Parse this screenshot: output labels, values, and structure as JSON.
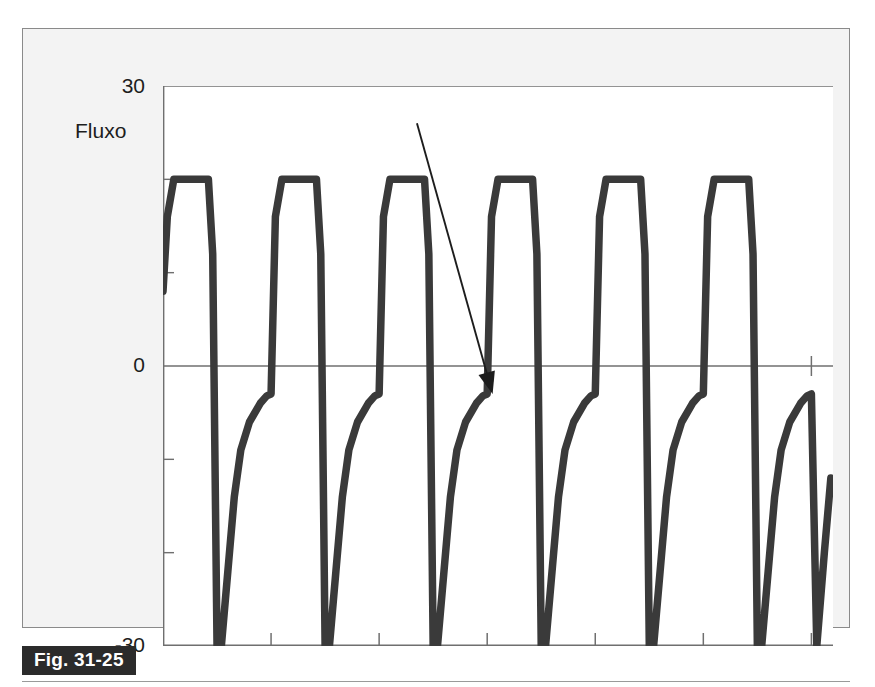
{
  "figure": {
    "caption_label": "Fig. 31-25",
    "axis_title": "Fluxo",
    "annotation": "Aprisionamento",
    "trace_label": "10"
  },
  "colors": {
    "trace": "#3a3a3a",
    "axis": "#6f6f6f",
    "panel_background": "#f3f3f3",
    "plot_background": "#ffffff",
    "caption_badge": "#2b2b2b",
    "text": "#1d1d1d"
  },
  "chart_data": {
    "type": "line",
    "title": "",
    "subtitle": "",
    "xlabel": "",
    "ylabel": "Fluxo",
    "ylim": [
      -30,
      30
    ],
    "ytick_labels": [
      "30",
      "0",
      "-30"
    ],
    "ytick_values": [
      30,
      0,
      -30
    ],
    "yminor_ticks": [
      20,
      10,
      -10,
      -20
    ],
    "xlim": [
      0,
      6.2
    ],
    "xtick_values": [
      1,
      2,
      3,
      4,
      5,
      6
    ],
    "xtick_labels": [
      "",
      "",
      "",
      "",
      "",
      ""
    ],
    "grid": false,
    "legend": null,
    "breath_count": 6,
    "inspiratory_plateau": 20,
    "expiratory_peak": -30,
    "expiratory_end_flow": -3,
    "annotations": [
      {
        "text": "Aprisionamento",
        "target_x": 3.05,
        "target_y": -3,
        "description": "Arrow indicating expiratory flow that does not return to zero baseline before the next inspiration"
      },
      {
        "text": "10",
        "target_x": 6.15,
        "target_y": -12,
        "description": "Label on the final truncated expiratory limb"
      }
    ],
    "series": [
      {
        "name": "Fluxo",
        "x": [
          0.0,
          0.04,
          0.1,
          0.14,
          0.42,
          0.46,
          0.5,
          0.54,
          0.6,
          0.66,
          0.72,
          0.8,
          0.9,
          0.96,
          1.0,
          1.04,
          1.1,
          1.14,
          1.42,
          1.46,
          1.5,
          1.54,
          1.6,
          1.66,
          1.72,
          1.8,
          1.9,
          1.96,
          2.0,
          2.04,
          2.1,
          2.14,
          2.42,
          2.46,
          2.5,
          2.54,
          2.6,
          2.66,
          2.72,
          2.8,
          2.9,
          2.96,
          3.0,
          3.04,
          3.1,
          3.14,
          3.42,
          3.46,
          3.5,
          3.54,
          3.6,
          3.66,
          3.72,
          3.8,
          3.9,
          3.96,
          4.0,
          4.04,
          4.1,
          4.14,
          4.42,
          4.46,
          4.5,
          4.54,
          4.6,
          4.66,
          4.72,
          4.8,
          4.9,
          4.96,
          5.0,
          5.04,
          5.1,
          5.14,
          5.42,
          5.46,
          5.5,
          5.54,
          5.6,
          5.66,
          5.72,
          5.8,
          5.9,
          5.96,
          6.0,
          6.05,
          6.12,
          6.18
        ],
        "y": [
          8,
          16,
          20,
          20,
          20,
          12,
          -30,
          -30,
          -22,
          -14,
          -9,
          -6,
          -4,
          -3.2,
          -3,
          16,
          20,
          20,
          20,
          12,
          -30,
          -30,
          -22,
          -14,
          -9,
          -6,
          -4,
          -3.2,
          -3,
          16,
          20,
          20,
          20,
          12,
          -30,
          -30,
          -22,
          -14,
          -9,
          -6,
          -4,
          -3.2,
          -3,
          16,
          20,
          20,
          20,
          12,
          -30,
          -30,
          -22,
          -14,
          -9,
          -6,
          -4,
          -3.2,
          -3,
          16,
          20,
          20,
          20,
          12,
          -30,
          -30,
          -22,
          -14,
          -9,
          -6,
          -4,
          -3.2,
          -3,
          16,
          20,
          20,
          20,
          12,
          -30,
          -30,
          -22,
          -14,
          -9,
          -6,
          -4,
          -3.2,
          -3,
          -30,
          -20,
          -12
        ]
      }
    ]
  }
}
